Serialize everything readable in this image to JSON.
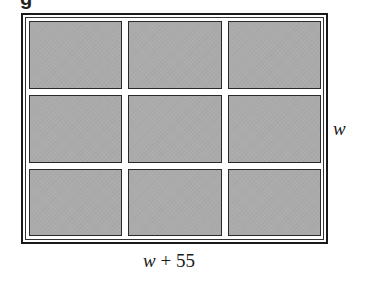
{
  "figure": {
    "cropped_caption_fragment": "g",
    "grid": {
      "rows": 3,
      "columns": 3,
      "cell_fill_color": "#ababab",
      "cell_border_color": "#2a2a2a",
      "frame_color": "#1a1a1a"
    },
    "labels": {
      "height_label": "w",
      "width_label_var": "w",
      "width_label_rest": " + 55"
    }
  }
}
